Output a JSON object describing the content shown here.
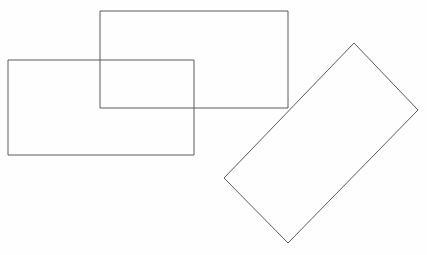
{
  "canvas": {
    "width": 427,
    "height": 255,
    "background_color": "#fefefe",
    "title": "Overlapping Rectangles"
  },
  "style": {
    "stroke_color": "#5a5a5a",
    "stroke_width": 1,
    "fill": "none"
  },
  "chart_data": {
    "type": "diagram",
    "subtitle": "",
    "xlabel": "",
    "ylabel": "",
    "grid": false,
    "legend": "none",
    "axis_visible": false,
    "xlim": [
      0,
      427
    ],
    "ylim": [
      0,
      255
    ],
    "shape_count": 3,
    "shapes": [
      {
        "name": "left-rectangle",
        "kind": "rectangle",
        "rotation_deg": 0,
        "x": 8,
        "y": 60,
        "width": 186,
        "height": 95,
        "points": [
          [
            8,
            60
          ],
          [
            194,
            60
          ],
          [
            194,
            155
          ],
          [
            8,
            155
          ]
        ],
        "stroke": "#5a5a5a",
        "fill": "none"
      },
      {
        "name": "upper-rectangle",
        "kind": "rectangle",
        "rotation_deg": 0,
        "x": 100,
        "y": 11,
        "width": 188,
        "height": 97,
        "points": [
          [
            100,
            11
          ],
          [
            288,
            11
          ],
          [
            288,
            108
          ],
          [
            100,
            108
          ]
        ],
        "stroke": "#5a5a5a",
        "fill": "none"
      },
      {
        "name": "rotated-rectangle",
        "kind": "rectangle",
        "rotation_deg": 46,
        "width": 93,
        "height": 185,
        "points": [
          [
            354,
            43
          ],
          [
            418,
            110
          ],
          [
            288,
            243
          ],
          [
            224,
            178
          ]
        ],
        "stroke": "#5a5a5a",
        "fill": "none"
      }
    ],
    "overlaps": [
      {
        "name": "left-upper-overlap",
        "between": [
          "left-rectangle",
          "upper-rectangle"
        ],
        "points": [
          [
            100,
            60
          ],
          [
            194,
            60
          ],
          [
            194,
            108
          ],
          [
            100,
            108
          ]
        ]
      },
      {
        "name": "upper-rotated-touchpoint",
        "between": [
          "upper-rectangle",
          "rotated-rectangle"
        ],
        "points": [
          [
            288,
            108
          ]
        ]
      }
    ]
  }
}
